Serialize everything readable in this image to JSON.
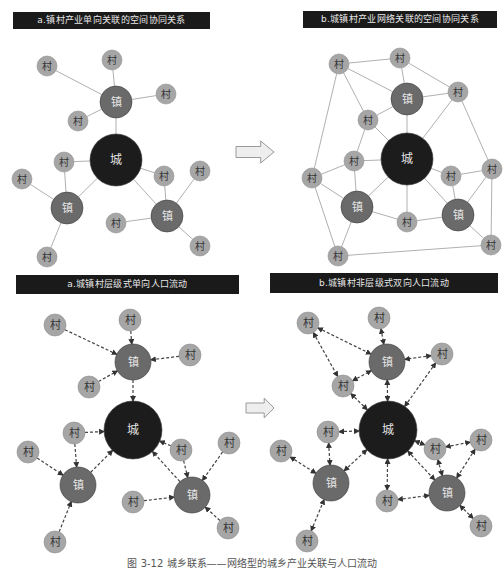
{
  "figure": {
    "caption": "图 3-12 城乡联系——网络型的城乡产业关联与人口流动",
    "colors": {
      "city": "#1c1c1c",
      "town": "#6a6a6a",
      "village": "#a6a6a6",
      "village_text": "#333333",
      "hub_text": "#e6e6e6",
      "edge": "#b0b0b0",
      "dashed_edge": "#444444",
      "title_bg": "#1a1a1a",
      "arrow_fill": "#eeeeee",
      "arrow_stroke": "#999999"
    },
    "labels": {
      "city": "城",
      "town": "镇",
      "village": "村"
    },
    "panels": [
      {
        "id": "top-left",
        "title": "a.镇村产业单向关联的空间协同关系",
        "title_box": {
          "x": 13,
          "y": 12,
          "w": 197,
          "h": 17
        },
        "edge_style": "solid",
        "nodes": [
          {
            "id": "C",
            "type": "city",
            "x": 116,
            "y": 160,
            "r": 26
          },
          {
            "id": "T1",
            "type": "town",
            "x": 116,
            "y": 102,
            "r": 16
          },
          {
            "id": "T2",
            "type": "town",
            "x": 67,
            "y": 208,
            "r": 16
          },
          {
            "id": "T3",
            "type": "town",
            "x": 167,
            "y": 216,
            "r": 16
          },
          {
            "id": "V1",
            "type": "village",
            "x": 47,
            "y": 66,
            "r": 10
          },
          {
            "id": "V2",
            "type": "village",
            "x": 112,
            "y": 60,
            "r": 10
          },
          {
            "id": "V3",
            "type": "village",
            "x": 166,
            "y": 94,
            "r": 10
          },
          {
            "id": "V4",
            "type": "village",
            "x": 78,
            "y": 121,
            "r": 10
          },
          {
            "id": "V5",
            "type": "village",
            "x": 64,
            "y": 162,
            "r": 10
          },
          {
            "id": "V6",
            "type": "village",
            "x": 22,
            "y": 179,
            "r": 10
          },
          {
            "id": "V7",
            "type": "village",
            "x": 47,
            "y": 257,
            "r": 10
          },
          {
            "id": "V8",
            "type": "village",
            "x": 116,
            "y": 223,
            "r": 10
          },
          {
            "id": "V9",
            "type": "village",
            "x": 164,
            "y": 176,
            "r": 10
          },
          {
            "id": "V10",
            "type": "village",
            "x": 200,
            "y": 171,
            "r": 10
          },
          {
            "id": "V11",
            "type": "village",
            "x": 200,
            "y": 246,
            "r": 10
          }
        ],
        "edges": [
          [
            "T1",
            "V1"
          ],
          [
            "T1",
            "V2"
          ],
          [
            "T1",
            "V3"
          ],
          [
            "T1",
            "V4"
          ],
          [
            "T1",
            "C"
          ],
          [
            "C",
            "V5"
          ],
          [
            "C",
            "T2"
          ],
          [
            "C",
            "V9"
          ],
          [
            "C",
            "T3"
          ],
          [
            "T2",
            "V5"
          ],
          [
            "T2",
            "V6"
          ],
          [
            "T2",
            "V7"
          ],
          [
            "T3",
            "V9"
          ],
          [
            "T3",
            "V10"
          ],
          [
            "T3",
            "V8"
          ],
          [
            "T3",
            "V11"
          ]
        ]
      },
      {
        "id": "top-right",
        "title": "b.城镇村产业网络关联的空间协同关系",
        "title_box": {
          "x": 303,
          "y": 11,
          "w": 194,
          "h": 17
        },
        "edge_style": "solid",
        "nodes": [
          {
            "id": "C",
            "type": "city",
            "x": 407,
            "y": 159,
            "r": 26
          },
          {
            "id": "T1",
            "type": "town",
            "x": 407,
            "y": 99,
            "r": 16
          },
          {
            "id": "T2",
            "type": "town",
            "x": 357,
            "y": 207,
            "r": 16
          },
          {
            "id": "T3",
            "type": "town",
            "x": 458,
            "y": 215,
            "r": 16
          },
          {
            "id": "V1",
            "type": "village",
            "x": 339,
            "y": 64,
            "r": 10
          },
          {
            "id": "V2",
            "type": "village",
            "x": 400,
            "y": 58,
            "r": 10
          },
          {
            "id": "V3",
            "type": "village",
            "x": 458,
            "y": 92,
            "r": 10
          },
          {
            "id": "V4",
            "type": "village",
            "x": 368,
            "y": 120,
            "r": 10
          },
          {
            "id": "V5",
            "type": "village",
            "x": 354,
            "y": 161,
            "r": 10
          },
          {
            "id": "V6",
            "type": "village",
            "x": 312,
            "y": 178,
            "r": 10
          },
          {
            "id": "V7",
            "type": "village",
            "x": 338,
            "y": 256,
            "r": 10
          },
          {
            "id": "V8",
            "type": "village",
            "x": 407,
            "y": 222,
            "r": 10
          },
          {
            "id": "V9",
            "type": "village",
            "x": 451,
            "y": 176,
            "r": 10
          },
          {
            "id": "V10",
            "type": "village",
            "x": 492,
            "y": 169,
            "r": 10
          },
          {
            "id": "V11",
            "type": "village",
            "x": 491,
            "y": 245,
            "r": 10
          }
        ],
        "edges": [
          [
            "V1",
            "V2"
          ],
          [
            "V2",
            "V3"
          ],
          [
            "V1",
            "T1"
          ],
          [
            "V2",
            "T1"
          ],
          [
            "V3",
            "T1"
          ],
          [
            "V1",
            "V4"
          ],
          [
            "V1",
            "V6"
          ],
          [
            "V3",
            "V10"
          ],
          [
            "V3",
            "C"
          ],
          [
            "T1",
            "V4"
          ],
          [
            "T1",
            "C"
          ],
          [
            "V4",
            "C"
          ],
          [
            "V4",
            "V5"
          ],
          [
            "V5",
            "V6"
          ],
          [
            "V5",
            "C"
          ],
          [
            "V5",
            "T2"
          ],
          [
            "V6",
            "T2"
          ],
          [
            "V6",
            "V7"
          ],
          [
            "T2",
            "C"
          ],
          [
            "T2",
            "V8"
          ],
          [
            "T2",
            "V7"
          ],
          [
            "C",
            "V8"
          ],
          [
            "C",
            "V9"
          ],
          [
            "C",
            "T3"
          ],
          [
            "V8",
            "T3"
          ],
          [
            "V9",
            "T3"
          ],
          [
            "V9",
            "V10"
          ],
          [
            "T3",
            "V10"
          ],
          [
            "T3",
            "V11"
          ],
          [
            "V10",
            "V11"
          ],
          [
            "V7",
            "V11"
          ]
        ]
      },
      {
        "id": "bottom-left",
        "title": "a.城镇村层级式单向人口流动",
        "title_box": {
          "x": 16,
          "y": 275,
          "w": 223,
          "h": 19
        },
        "edge_style": "dashed",
        "arrows": "single",
        "nodes": [
          {
            "id": "C",
            "type": "city",
            "x": 133,
            "y": 430,
            "r": 29
          },
          {
            "id": "T1",
            "type": "town",
            "x": 133,
            "y": 362,
            "r": 18
          },
          {
            "id": "T2",
            "type": "town",
            "x": 78,
            "y": 485,
            "r": 18
          },
          {
            "id": "T3",
            "type": "town",
            "x": 192,
            "y": 495,
            "r": 18
          },
          {
            "id": "V1",
            "type": "village",
            "x": 55,
            "y": 325,
            "r": 11
          },
          {
            "id": "V2",
            "type": "village",
            "x": 130,
            "y": 320,
            "r": 11
          },
          {
            "id": "V3",
            "type": "village",
            "x": 190,
            "y": 355,
            "r": 11
          },
          {
            "id": "V4",
            "type": "village",
            "x": 89,
            "y": 387,
            "r": 11
          },
          {
            "id": "V5",
            "type": "village",
            "x": 74,
            "y": 433,
            "r": 11
          },
          {
            "id": "V6",
            "type": "village",
            "x": 28,
            "y": 452,
            "r": 11
          },
          {
            "id": "V7",
            "type": "village",
            "x": 55,
            "y": 542,
            "r": 11
          },
          {
            "id": "V8",
            "type": "village",
            "x": 133,
            "y": 502,
            "r": 11
          },
          {
            "id": "V9",
            "type": "village",
            "x": 181,
            "y": 450,
            "r": 11
          },
          {
            "id": "V10",
            "type": "village",
            "x": 229,
            "y": 443,
            "r": 11
          },
          {
            "id": "V11",
            "type": "village",
            "x": 228,
            "y": 528,
            "r": 11
          }
        ],
        "edges": [
          [
            "V1",
            "T1"
          ],
          [
            "V2",
            "T1"
          ],
          [
            "V3",
            "T1"
          ],
          [
            "V4",
            "T1"
          ],
          [
            "T1",
            "C"
          ],
          [
            "V5",
            "C"
          ],
          [
            "V5",
            "T2"
          ],
          [
            "V6",
            "T2"
          ],
          [
            "V7",
            "T2"
          ],
          [
            "T2",
            "C"
          ],
          [
            "V9",
            "C"
          ],
          [
            "V9",
            "T3"
          ],
          [
            "V10",
            "T3"
          ],
          [
            "V8",
            "T3"
          ],
          [
            "V11",
            "T3"
          ],
          [
            "T3",
            "C"
          ]
        ]
      },
      {
        "id": "bottom-right",
        "title": "b.城镇村非层级式双向人口流动",
        "title_box": {
          "x": 270,
          "y": 273,
          "w": 228,
          "h": 20
        },
        "edge_style": "dashed",
        "arrows": "double",
        "nodes": [
          {
            "id": "C",
            "type": "city",
            "x": 388,
            "y": 430,
            "r": 29
          },
          {
            "id": "T1",
            "type": "town",
            "x": 387,
            "y": 362,
            "r": 18
          },
          {
            "id": "T2",
            "type": "town",
            "x": 331,
            "y": 483,
            "r": 18
          },
          {
            "id": "T3",
            "type": "town",
            "x": 447,
            "y": 493,
            "r": 18
          },
          {
            "id": "V1",
            "type": "village",
            "x": 308,
            "y": 323,
            "r": 11
          },
          {
            "id": "V2",
            "type": "village",
            "x": 379,
            "y": 318,
            "r": 11
          },
          {
            "id": "V3",
            "type": "village",
            "x": 442,
            "y": 354,
            "r": 11
          },
          {
            "id": "V4",
            "type": "village",
            "x": 343,
            "y": 386,
            "r": 11
          },
          {
            "id": "V5",
            "type": "village",
            "x": 328,
            "y": 432,
            "r": 11
          },
          {
            "id": "V6",
            "type": "village",
            "x": 281,
            "y": 451,
            "r": 11
          },
          {
            "id": "V7",
            "type": "village",
            "x": 307,
            "y": 541,
            "r": 11
          },
          {
            "id": "V8",
            "type": "village",
            "x": 387,
            "y": 501,
            "r": 11
          },
          {
            "id": "V9",
            "type": "village",
            "x": 435,
            "y": 449,
            "r": 11
          },
          {
            "id": "V10",
            "type": "village",
            "x": 481,
            "y": 440,
            "r": 11
          },
          {
            "id": "V11",
            "type": "village",
            "x": 481,
            "y": 526,
            "r": 11
          }
        ],
        "edges": [
          [
            "V1",
            "T1"
          ],
          [
            "V1",
            "V4"
          ],
          [
            "V2",
            "T1"
          ],
          [
            "V3",
            "T1"
          ],
          [
            "V3",
            "C"
          ],
          [
            "V4",
            "T1"
          ],
          [
            "T1",
            "C"
          ],
          [
            "V4",
            "C"
          ],
          [
            "V5",
            "C"
          ],
          [
            "V5",
            "T2"
          ],
          [
            "V6",
            "T2"
          ],
          [
            "V7",
            "T2"
          ],
          [
            "T2",
            "C"
          ],
          [
            "C",
            "V8"
          ],
          [
            "C",
            "V9"
          ],
          [
            "C",
            "T3"
          ],
          [
            "V8",
            "T3"
          ],
          [
            "V9",
            "T3"
          ],
          [
            "V9",
            "V10"
          ],
          [
            "V10",
            "T3"
          ],
          [
            "V11",
            "T3"
          ]
        ]
      }
    ],
    "transition_arrows": [
      {
        "id": "top-arrow",
        "x": 236,
        "y": 141,
        "w": 38,
        "h": 22
      },
      {
        "id": "bottom-arrow",
        "x": 246,
        "y": 398,
        "w": 28,
        "h": 20
      }
    ]
  }
}
